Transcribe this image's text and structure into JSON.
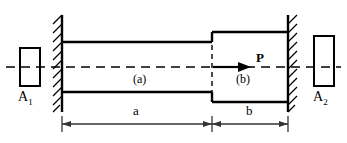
{
  "figure": {
    "colors": {
      "stroke": "#000000",
      "background": "#ffffff",
      "dimension": "#333333"
    },
    "labels": {
      "area_left": "A",
      "area_left_sub": "1",
      "area_right": "A",
      "area_right_sub": "2",
      "segment_a": "(a)",
      "segment_b": "(b)",
      "force": "P",
      "dim_a": "a",
      "dim_b": "b"
    },
    "icons": {
      "left_support": "fixed-wall-hatched-icon",
      "right_support": "fixed-wall-hatched-icon",
      "axis": "centerline-dashed-icon",
      "force_arrow": "arrow-right-icon",
      "dimension_line": "dimension-line-icon"
    },
    "geometry": {
      "axis_y": 67,
      "left_wall_x": 62,
      "right_wall_x": 288,
      "step_x": 212,
      "thin_top_y": 42,
      "thin_bottom_y": 92,
      "thick_top_y": 32,
      "thick_bottom_y": 102,
      "dimension_y": 124,
      "segment_a_length_px": 150,
      "segment_b_length_px": 76
    }
  }
}
